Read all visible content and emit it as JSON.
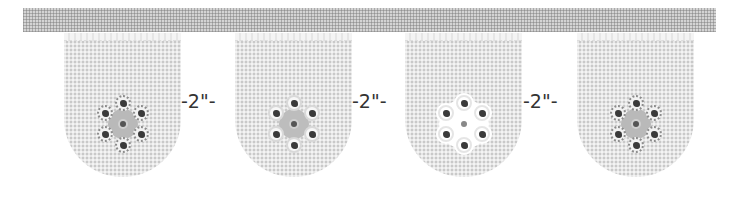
{
  "diagram": {
    "band": {
      "color": "#d4d4d4",
      "pattern": "gingham"
    },
    "pennants": [
      {
        "id": 1,
        "flower_style": "dotted-outline"
      },
      {
        "id": 2,
        "flower_style": "solid-outline"
      },
      {
        "id": 3,
        "flower_style": "white-halo"
      },
      {
        "id": 4,
        "flower_style": "dotted-outline"
      }
    ],
    "gap_labels": [
      "-2\"-",
      "-2\"-",
      "-2\"-"
    ],
    "colors": {
      "fabric": "#c9c9c9",
      "text": "#333333",
      "ruffle": "#f4f4f4"
    }
  }
}
